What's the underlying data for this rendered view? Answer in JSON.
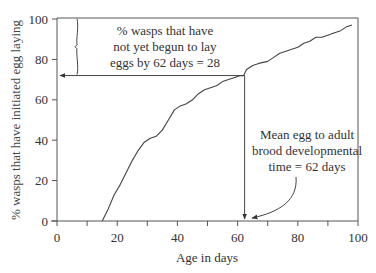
{
  "chart_data": {
    "type": "line",
    "title": "",
    "xlabel": "Age in days",
    "ylabel": "% wasps that have initiated egg laying",
    "xlim": [
      0,
      100
    ],
    "ylim": [
      0,
      100
    ],
    "xticks": [
      0,
      20,
      40,
      60,
      80,
      100
    ],
    "xminor_ticks": [
      10,
      30,
      50,
      70,
      90
    ],
    "yticks": [
      0,
      20,
      40,
      60,
      80,
      100
    ],
    "grid": false,
    "series": [
      {
        "name": "cumulative egg laying",
        "x": [
          15,
          17,
          19,
          21,
          23,
          25,
          27,
          29,
          31,
          33,
          35,
          37,
          39,
          41,
          43,
          45,
          47,
          49,
          51,
          53,
          55,
          57,
          59,
          61,
          62,
          63,
          65,
          67,
          70,
          72,
          74,
          76,
          78,
          80,
          82,
          84,
          86,
          88,
          90,
          92,
          94,
          96,
          98
        ],
        "y": [
          0,
          6,
          13,
          18,
          24,
          30,
          35,
          39,
          41,
          42,
          45,
          50,
          55,
          57,
          58,
          60,
          63,
          65,
          66,
          67,
          69,
          70,
          71,
          72,
          72,
          75,
          77,
          78,
          79,
          81,
          83,
          84,
          85,
          86,
          88,
          89,
          91,
          91,
          92,
          93,
          94,
          96,
          97
        ]
      }
    ],
    "annotations": [
      {
        "text_lines": [
          "% wasps that have",
          "not yet begun to lay",
          "eggs by 62 days = 28"
        ],
        "type": "brace-and-horizontal-arrow",
        "brace_y_range": [
          72,
          100
        ],
        "arrow_y": 72,
        "arrow_from_x": 62,
        "arrow_to_x": 0
      },
      {
        "text_lines": [
          "Mean egg to adult",
          "brood developmental",
          "time = 62 days"
        ],
        "type": "vertical-arrow-and-curved-pointer",
        "vertical_x": 62,
        "vertical_from_y": 72,
        "vertical_to_y": 0
      }
    ]
  }
}
